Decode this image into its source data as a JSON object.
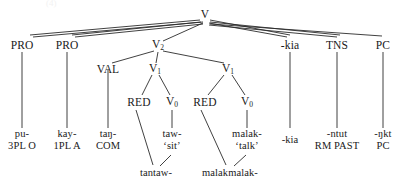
{
  "diagram": {
    "type": "syntactic-tree",
    "language_example": "Kalam-style verbal complex tree",
    "ghost_text": "(4)",
    "nodes": {
      "root": {
        "label": "V",
        "sub": ""
      },
      "row2": [
        {
          "id": "pro1",
          "label": "PRO",
          "sub": ""
        },
        {
          "id": "pro2",
          "label": "PRO",
          "sub": ""
        },
        {
          "id": "v2",
          "label": "V",
          "sub": "2"
        },
        {
          "id": "kia",
          "label": "-kia",
          "sub": ""
        },
        {
          "id": "tns",
          "label": "TNS",
          "sub": ""
        },
        {
          "id": "pc",
          "label": "PC",
          "sub": ""
        }
      ],
      "row3": [
        {
          "id": "val",
          "label": "VAL",
          "sub": ""
        },
        {
          "id": "v1a",
          "label": "V",
          "sub": "1"
        },
        {
          "id": "v1b",
          "label": "V",
          "sub": "1"
        }
      ],
      "row4": [
        {
          "id": "red1",
          "label": "RED",
          "sub": ""
        },
        {
          "id": "v0a",
          "label": "V",
          "sub": "0"
        },
        {
          "id": "red2",
          "label": "RED",
          "sub": ""
        },
        {
          "id": "v0b",
          "label": "V",
          "sub": "0"
        }
      ]
    },
    "leaves": [
      {
        "id": "leaf-pu",
        "line1": "pu-",
        "line2": "3PL O"
      },
      {
        "id": "leaf-kay",
        "line1": "kay-",
        "line2": "1PL A"
      },
      {
        "id": "leaf-tang",
        "line1": "taŋ-",
        "line2": "COM"
      },
      {
        "id": "leaf-taw",
        "line1": "taw-",
        "line2": "‘sit’"
      },
      {
        "id": "leaf-malak",
        "line1": "malak-",
        "line2": "‘talk’"
      },
      {
        "id": "leaf-kia",
        "line1": "-kia",
        "line2": ""
      },
      {
        "id": "leaf-ntut",
        "line1": "-ntut",
        "line2": "RM PAST"
      },
      {
        "id": "leaf-ngkt",
        "line1": "-ŋkt",
        "line2": "PC"
      }
    ],
    "compounds": [
      {
        "id": "compound-tantaw",
        "text": "tantaw-"
      },
      {
        "id": "compound-malakmalak",
        "text": "malakmalak-"
      }
    ],
    "colors": {
      "line": "#2b2b2b",
      "text": "#1a1a1a",
      "background": "#ffffff"
    }
  }
}
